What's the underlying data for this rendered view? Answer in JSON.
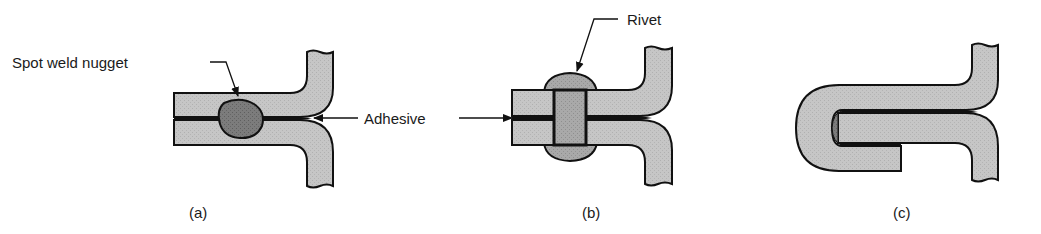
{
  "diagram": {
    "labels": {
      "spot_weld": "Spot weld nugget",
      "adhesive": "Adhesive",
      "rivet": "Rivet"
    },
    "captions": {
      "a": "(a)",
      "b": "(b)",
      "c": "(c)"
    },
    "colors": {
      "plate_fill": "#c4c4c4",
      "nugget_fill": "#7a7a7a",
      "rivet_fill": "#a8a8a8",
      "outline": "#111111",
      "adhesive": "#111111"
    },
    "figures": [
      {
        "id": "a",
        "joint": "spot weld + adhesive (weld-bonding)"
      },
      {
        "id": "b",
        "joint": "rivet + adhesive (rivet-bonding)"
      },
      {
        "id": "c",
        "joint": "hem flange + adhesive"
      }
    ]
  }
}
